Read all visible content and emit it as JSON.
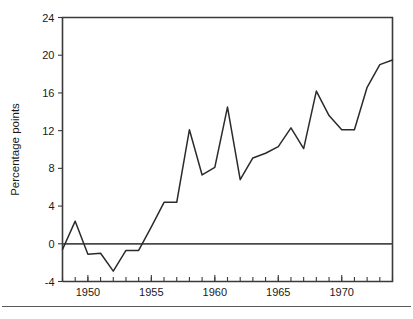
{
  "chart_data": {
    "type": "line",
    "title": "",
    "subtitle": "",
    "xlabel": "",
    "ylabel": "Percentage points",
    "xlim": [
      1948,
      1974
    ],
    "ylim": [
      -4,
      24
    ],
    "grid": false,
    "legend": null,
    "x_tick_labels": [
      "1950",
      "1955",
      "1960",
      "1965",
      "1970"
    ],
    "x_tick_values": [
      1950,
      1955,
      1960,
      1965,
      1970
    ],
    "x_minor_ticks_every": 1,
    "y_tick_labels": [
      "24",
      "20",
      "16",
      "12",
      "8",
      "4",
      "0",
      "-4"
    ],
    "y_tick_values": [
      24,
      20,
      16,
      12,
      8,
      4,
      0,
      -4
    ],
    "zero_reference_line": 0,
    "series": [
      {
        "name": "Percentage points",
        "color": "#2b2b2b",
        "x": [
          1948,
          1949,
          1950,
          1951,
          1952,
          1953,
          1954,
          1955,
          1956,
          1957,
          1958,
          1959,
          1960,
          1961,
          1962,
          1963,
          1964,
          1965,
          1966,
          1967,
          1968,
          1969,
          1970,
          1971,
          1972,
          1973,
          1974
        ],
        "values": [
          -0.6,
          2.4,
          -1.1,
          -1.0,
          -2.9,
          -0.7,
          -0.7,
          1.8,
          4.4,
          4.4,
          12.1,
          7.3,
          8.1,
          14.5,
          6.8,
          9.1,
          9.6,
          10.3,
          12.3,
          10.1,
          16.2,
          13.6,
          12.1,
          12.1,
          16.6,
          19.0,
          19.5
        ]
      }
    ]
  },
  "figure": {
    "axis_color": "#3a3a3a",
    "line_color": "#2b2b2b",
    "background": "#ffffff"
  }
}
